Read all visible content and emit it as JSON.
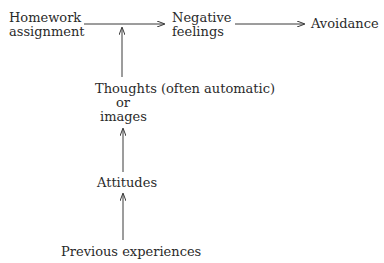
{
  "diagram": {
    "type": "flow",
    "nodes": {
      "homework": {
        "line1": "Homework",
        "line2": "assignment"
      },
      "negative": {
        "line1": "Negative",
        "line2": "feelings"
      },
      "avoidance": {
        "label": "Avoidance"
      },
      "thoughts": {
        "line1": "Thoughts (often automatic)",
        "line2": "or",
        "line3": "images"
      },
      "attitudes": {
        "label": "Attitudes"
      },
      "previous": {
        "label": "Previous experiences"
      }
    },
    "edges": [
      {
        "from": "Homework assignment",
        "to": "Negative feelings"
      },
      {
        "from": "Negative feelings",
        "to": "Avoidance"
      },
      {
        "from": "Thoughts (often automatic) or images",
        "to": "Homework assignment → Negative feelings arrow"
      },
      {
        "from": "Attitudes",
        "to": "Thoughts (often automatic) or images"
      },
      {
        "from": "Previous experiences",
        "to": "Attitudes"
      }
    ],
    "colors": {
      "text": "#2a2a2a",
      "arrow": "#3a3a3a",
      "background": "#ffffff"
    }
  }
}
